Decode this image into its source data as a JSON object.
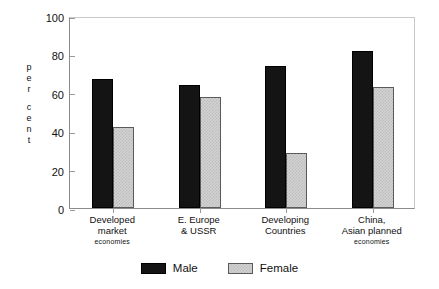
{
  "chart_data": {
    "type": "bar",
    "title": "",
    "subtitle": "",
    "xlabel": "",
    "ylabel": "per cent",
    "ylim": [
      0,
      100
    ],
    "yticks": [
      0,
      20,
      40,
      60,
      80,
      100
    ],
    "ytick_labels": [
      "0",
      "20",
      "40",
      "60",
      "80",
      "100"
    ],
    "grid": false,
    "legend_position": "bottom-center",
    "categories": [
      "Developed market economies",
      "E. Europe & USSR",
      "Developing Countries",
      "China, Asian planned economies"
    ],
    "category_lines": [
      [
        "Developed",
        "market",
        "economies"
      ],
      [
        "E. Europe",
        "& USSR",
        ""
      ],
      [
        "Developing",
        "Countries",
        ""
      ],
      [
        "China,",
        "Asian planned",
        "economies"
      ]
    ],
    "series": [
      {
        "name": "Male",
        "color": "#141414",
        "values": [
          67,
          64,
          74,
          82
        ]
      },
      {
        "name": "Female",
        "color": "#d2d2d2",
        "values": [
          42,
          58,
          28.5,
          63
        ]
      }
    ]
  },
  "y_axis": {
    "title_letters": [
      "p",
      "e",
      "r",
      "c",
      "e",
      "n",
      "t"
    ],
    "tick_labels": [
      "100",
      "80",
      "60",
      "40",
      "20",
      "0"
    ]
  },
  "legend": {
    "entries": [
      {
        "label": "Male"
      },
      {
        "label": "Female"
      }
    ]
  }
}
